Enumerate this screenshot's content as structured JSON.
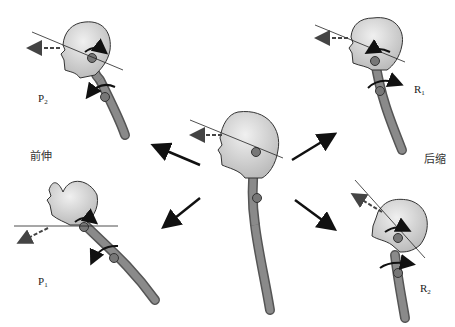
{
  "diagram": {
    "type": "head-posture-diagram",
    "center": {
      "description": "neutral head position"
    },
    "panels": [
      {
        "id": "P2",
        "label_main": "P",
        "label_sub": "2",
        "position": "top-left"
      },
      {
        "id": "P1",
        "label_main": "P",
        "label_sub": "1",
        "position": "bottom-left"
      },
      {
        "id": "R1",
        "label_main": "R",
        "label_sub": "1",
        "position": "top-right"
      },
      {
        "id": "R2",
        "label_main": "R",
        "label_sub": "2",
        "position": "bottom-right"
      }
    ],
    "group_labels": {
      "left": "前伸",
      "right": "后缩"
    }
  }
}
